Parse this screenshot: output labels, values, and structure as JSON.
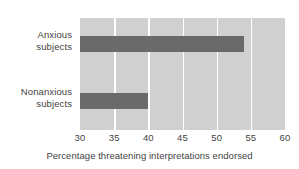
{
  "chart_data": {
    "type": "bar",
    "orientation": "horizontal",
    "title": "",
    "xlabel": "Percentage threatening interpretations endorsed",
    "ylabel": "",
    "categories": [
      "Anxious subjects",
      "Nonanxious subjects"
    ],
    "category_lines": [
      {
        "line1": "Anxious",
        "line2": "subjects"
      },
      {
        "line1": "Nonanxious",
        "line2": "subjects"
      }
    ],
    "values": [
      54,
      40
    ],
    "xlim": [
      30,
      60
    ],
    "xticks": [
      30,
      35,
      40,
      45,
      50,
      55,
      60
    ],
    "xtick_labels": [
      "30",
      "35",
      "40",
      "45",
      "50",
      "55",
      "60"
    ],
    "grid": true,
    "legend": false,
    "colors": {
      "bar": "#6a6a6a",
      "plot_background": "#d0d0d0",
      "gridline": "#ffffff",
      "text": "#444444",
      "figure_background": "#ffffff"
    }
  }
}
